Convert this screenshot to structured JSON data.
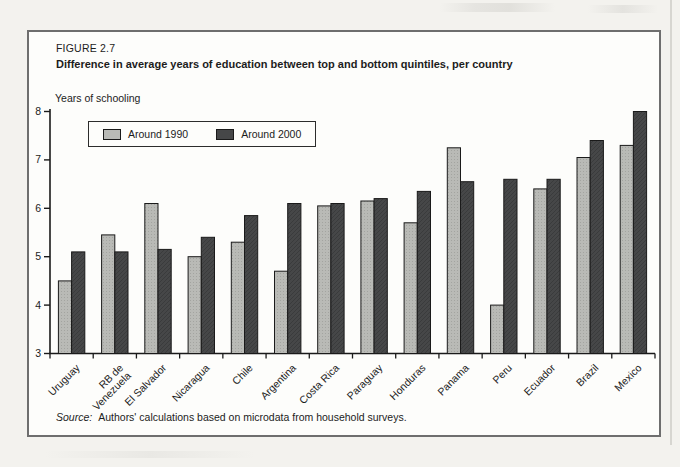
{
  "figure": {
    "label": "FIGURE 2.7",
    "title": "Difference in average years of education between top and bottom quintiles, per country",
    "y_axis_title": "Years of schooling",
    "source_label": "Source:",
    "source_text": "Authors' calculations based on microdata from household surveys."
  },
  "colors": {
    "series_1990": "#b9bab6",
    "series_1990_dot": "#a3a4a0",
    "series_2000": "#464748",
    "series_2000_hatch": "#3a3b3c",
    "bar_outline": "#1a1a1a",
    "axis": "#1a1a1a",
    "text": "#1c1c1c",
    "box_border": "#6e6e6e",
    "page_background": "#f3f2ee",
    "figure_background": "#fdfdfb"
  },
  "chart_data": {
    "type": "bar",
    "title": "Difference in average years of education between top and bottom quintiles, per country",
    "xlabel": "",
    "ylabel": "Years of schooling",
    "ylim": [
      3,
      8
    ],
    "yticks": [
      3,
      4,
      5,
      6,
      7,
      8
    ],
    "grid": false,
    "legend_position": "top-left-inside",
    "categories": [
      "Uruguay",
      "RB de\nVenezuela",
      "El Salvador",
      "Nicaragua",
      "Chile",
      "Argentina",
      "Costa Rica",
      "Paraguay",
      "Honduras",
      "Panama",
      "Peru",
      "Ecuador",
      "Brazil",
      "Mexico"
    ],
    "series": [
      {
        "name": "Around 1990",
        "color": "#b9bab6",
        "values": [
          4.5,
          5.45,
          6.1,
          5.0,
          5.3,
          4.7,
          6.05,
          6.15,
          5.7,
          7.25,
          4.0,
          6.4,
          7.05,
          7.3
        ]
      },
      {
        "name": "Around 2000",
        "color": "#464748",
        "values": [
          5.1,
          5.1,
          5.15,
          5.4,
          5.85,
          6.1,
          6.1,
          6.2,
          6.35,
          6.55,
          6.6,
          6.6,
          7.4,
          8.0
        ]
      }
    ]
  }
}
